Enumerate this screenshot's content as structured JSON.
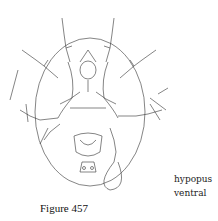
{
  "figure": {
    "caption": "Figure 457",
    "labels": [
      "hypopus",
      "ventral"
    ],
    "illustration": "mite-hypopus-ventral-view"
  }
}
